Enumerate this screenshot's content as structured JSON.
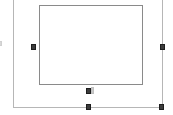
{
  "canvas": {
    "width": 173,
    "height": 115,
    "background_color": "#ffffff",
    "description": "Object selection on a blank white canvas"
  },
  "outer_frame": {
    "name": "Selection bounding box",
    "border_color": "#b6b6b6",
    "left": 13,
    "right": 162,
    "bottom": 107,
    "top_cropped": true,
    "edges": [
      {
        "id": "left",
        "label": "Left edge",
        "x": 13,
        "y": 0,
        "length": 108
      },
      {
        "id": "right",
        "label": "Right edge",
        "x": 162,
        "y": 0,
        "length": 108
      },
      {
        "id": "bottom",
        "label": "Bottom edge",
        "x": 13,
        "y": 107,
        "length": 150
      }
    ]
  },
  "inner_rect": {
    "name": "Selected rectangle",
    "border_color": "#8a8a8a",
    "fill_color": "#ffffff",
    "x": 39,
    "y": 5,
    "width": 104,
    "height": 80
  },
  "handles": [
    {
      "id": "left-edge-partial",
      "label": "Partial handle at canvas edge",
      "x": -2,
      "y": 41,
      "w": 4,
      "h": 5,
      "style": "faint"
    },
    {
      "id": "middle-left",
      "label": "Middle-left resize handle",
      "x": 31,
      "y": 44,
      "w": 5,
      "h": 6,
      "style": "solid"
    },
    {
      "id": "middle-right",
      "label": "Middle-right resize handle",
      "x": 160,
      "y": 44,
      "w": 5,
      "h": 6,
      "style": "solid"
    },
    {
      "id": "bottom-center-inner",
      "label": "Bottom-center inner handle",
      "x": 86,
      "y": 88,
      "w": 5,
      "h": 6,
      "style": "solid"
    },
    {
      "id": "bottom-center-ghost",
      "label": "Bottom-center ghost marker",
      "x": 91,
      "y": 87,
      "w": 3,
      "h": 7,
      "style": "ghost"
    },
    {
      "id": "bottom-center-outer",
      "label": "Bottom-center resize handle",
      "x": 86,
      "y": 104,
      "w": 5,
      "h": 6,
      "style": "solid"
    },
    {
      "id": "bottom-right",
      "label": "Bottom-right corner handle",
      "x": 159,
      "y": 104,
      "w": 5,
      "h": 6,
      "style": "solid"
    }
  ]
}
